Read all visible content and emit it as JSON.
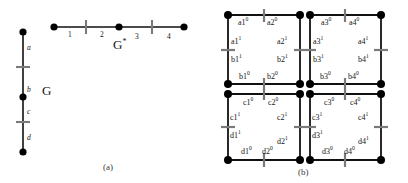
{
  "figure": {
    "caption_a": "(a)",
    "caption_b": "(b)",
    "panel_a": {
      "graph_g_label": "G",
      "graph_gstar_label": "G",
      "graph_gstar_superscript": "*",
      "vertical_edge_labels": [
        "a",
        "b",
        "c",
        "d"
      ],
      "horizontal_edge_labels": [
        "1",
        "2",
        "3",
        "4"
      ]
    },
    "panel_b": {
      "quadrant_top_left": {
        "top_labels": [
          "a1",
          "a2"
        ],
        "top_superscripts": [
          "0",
          "0"
        ],
        "left_upper_label": "a1",
        "left_upper_sup": "1",
        "left_lower_label": "b1",
        "left_lower_sup": "1",
        "right_upper_label": "a2",
        "right_upper_sup": "1",
        "right_lower_label": "b2",
        "right_lower_sup": "1",
        "bottom_labels": [
          "b1",
          "b2"
        ],
        "bottom_superscripts": [
          "0",
          "0"
        ]
      },
      "quadrant_top_right": {
        "top_labels": [
          "a3",
          "a4"
        ],
        "top_superscripts": [
          "0",
          "0"
        ],
        "left_upper_label": "a3",
        "left_upper_sup": "1",
        "left_lower_label": "b3",
        "left_lower_sup": "1",
        "right_upper_label": "a4",
        "right_upper_sup": "1",
        "right_lower_label": "b4",
        "right_lower_sup": "1",
        "bottom_labels": [
          "b3",
          "b4"
        ],
        "bottom_superscripts": [
          "0",
          "0"
        ]
      },
      "quadrant_bottom_left": {
        "top_labels": [
          "c1",
          "c2"
        ],
        "top_superscripts": [
          "0",
          "0"
        ],
        "left_upper_label": "c1",
        "left_upper_sup": "1",
        "left_lower_label": "d1",
        "left_lower_sup": "1",
        "right_upper_label": "c2",
        "right_upper_sup": "1",
        "right_lower_label": "d2",
        "right_lower_sup": "1",
        "bottom_labels": [
          "d1",
          "d2"
        ],
        "bottom_superscripts": [
          "0",
          "0"
        ]
      },
      "quadrant_bottom_right": {
        "top_labels": [
          "c3",
          "c4"
        ],
        "top_superscripts": [
          "0",
          "0"
        ],
        "left_upper_label": "c3",
        "left_upper_sup": "1",
        "left_lower_label": "d3",
        "left_lower_sup": "1",
        "right_upper_label": "c4",
        "right_upper_sup": "1",
        "right_lower_label": "d4",
        "right_lower_sup": "1",
        "bottom_labels": [
          "d3",
          "d4"
        ],
        "bottom_superscripts": [
          "0",
          "0"
        ]
      }
    },
    "colors": {
      "line": "#111111",
      "node": "#000000",
      "tick": "#6e6e6e",
      "text": "#151515",
      "background": "#ffffff"
    }
  }
}
